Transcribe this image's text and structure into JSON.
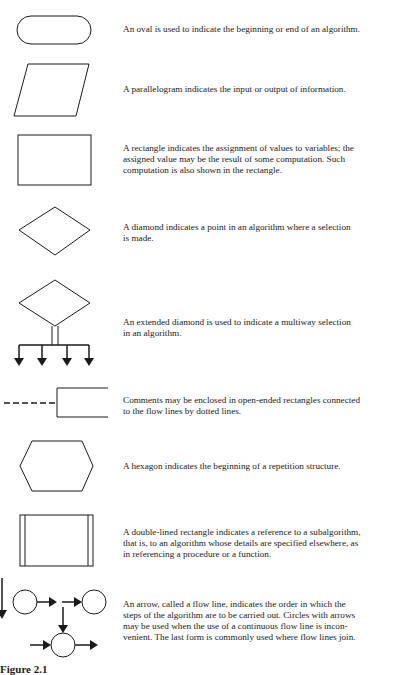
{
  "figure": {
    "caption": "Figure 2.1",
    "stroke_color": "#1a1a1a",
    "entries": [
      {
        "symbol": "oval",
        "description": "An oval is used to indicate the beginning or end of an algorithm."
      },
      {
        "symbol": "parallelogram",
        "description": "A parallelogram indicates the input or output of information."
      },
      {
        "symbol": "rectangle",
        "description": "A rectangle indicates the assignment of values to variables; the\nassigned value may be the result of some computation.  Such\ncomputation is also shown in the rectangle."
      },
      {
        "symbol": "diamond",
        "description": "A diamond indicates a point in an algorithm where a selection\nis made."
      },
      {
        "symbol": "extended-diamond",
        "description": "An extended diamond is used to indicate a multiway selection\nin an algorithm."
      },
      {
        "symbol": "open-ended-rectangle",
        "description": "Comments may be enclosed in open-ended rectangles connected\nto the flow lines by dotted lines."
      },
      {
        "symbol": "hexagon",
        "description": "A hexagon indicates the beginning of a repetition structure."
      },
      {
        "symbol": "double-lined-rectangle",
        "description": "A double-lined rectangle indicates a reference to a subalgorithm,\nthat is, to an algorithm whose details are specified elsewhere, as\nin referencing a procedure or a function."
      },
      {
        "symbol": "flow-line-arrows-and-circles",
        "description": "An arrow, called a flow line, indicates the order in which the\nsteps of the algorithm are to be carried out.  Circles with arrows\nmay be used when the use of a continuous flow line is incon-\nvenient.  The last form is commonly used where flow lines join."
      }
    ]
  }
}
